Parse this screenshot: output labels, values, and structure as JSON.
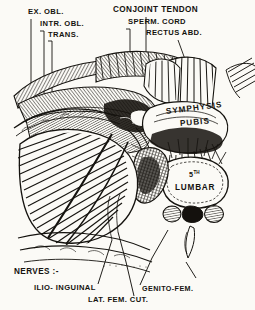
{
  "figure": {
    "title_absent": true,
    "style": "monochrome line engraving / anatomical plate",
    "background_color": "#fbfaf6",
    "ink_color": "#15130f"
  },
  "labels": {
    "top_left": [
      {
        "id": "ex-obl",
        "text": "EX. OBL.",
        "x": 28,
        "y": 12
      },
      {
        "id": "intr-obl",
        "text": "INTR. OBL.",
        "x": 40,
        "y": 24
      },
      {
        "id": "trans",
        "text": "TRANS.",
        "x": 48,
        "y": 35
      }
    ],
    "top_right": [
      {
        "id": "conjoint-tendon",
        "text": "CONJOINT  TENDON",
        "x": 113,
        "y": 10
      },
      {
        "id": "sperm-cord",
        "text": "SPERM. CORD",
        "x": 128,
        "y": 22
      },
      {
        "id": "rectus-abd",
        "text": "RECTUS ABD.",
        "x": 146,
        "y": 33
      }
    ],
    "on_figure": [
      {
        "id": "symphysis",
        "text": "SYMPHYSIS",
        "x": 168,
        "y": 113
      },
      {
        "id": "pubis",
        "text": "PUBIS",
        "x": 182,
        "y": 125
      },
      {
        "id": "fifth-ordinal",
        "text": "5",
        "superscript": "TH",
        "x": 190,
        "y": 175
      },
      {
        "id": "lumbar",
        "text": "LUMBAR",
        "x": 177,
        "y": 189
      }
    ],
    "bottom": [
      {
        "id": "nerves-heading",
        "text": "NERVES :-",
        "x": 14,
        "y": 272
      },
      {
        "id": "ilio-inguinal",
        "text": "ILIO- INGUINAL",
        "x": 34,
        "y": 288
      },
      {
        "id": "lat-fem-cut",
        "text": "LAT. FEM. CUT.",
        "x": 88,
        "y": 300
      },
      {
        "id": "genito-fem",
        "text": "GENITO-FEM.",
        "x": 142,
        "y": 289
      }
    ]
  },
  "structures": {
    "muscle_layers": [
      "External oblique",
      "Internal oblique",
      "Transversus abdominis"
    ],
    "cord_structures": [
      "Conjoint tendon",
      "Spermatic cord",
      "Rectus abdominis"
    ],
    "bony_landmarks": [
      "Symphysis pubis",
      "Fifth lumbar vertebra",
      "Iliac fossa",
      "Iliac crest"
    ],
    "nerves": [
      "Ilio-inguinal",
      "Lateral femoral cutaneous",
      "Genito-femoral"
    ]
  }
}
